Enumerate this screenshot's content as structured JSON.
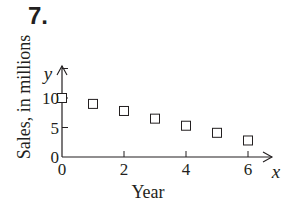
{
  "problem": {
    "number": "7."
  },
  "chart_data": {
    "type": "scatter",
    "title": "",
    "xlabel": "Year",
    "ylabel": "Sales, in millions",
    "x_axis_var": "x",
    "y_axis_var": "y",
    "x": [
      0,
      1,
      2,
      3,
      4,
      5,
      6
    ],
    "series": [
      {
        "name": "Sales",
        "marker": "open-square",
        "values": [
          10,
          9,
          7.8,
          6.5,
          5.3,
          4.1,
          2.8
        ]
      }
    ],
    "xticks": [
      0,
      2,
      4,
      6
    ],
    "yticks": [
      0,
      5,
      10
    ],
    "xtick_labels": [
      "0",
      "2",
      "4",
      "6"
    ],
    "ytick_labels": [
      "0",
      "5",
      "10"
    ],
    "xlim": [
      0,
      6.8
    ],
    "ylim": [
      0,
      14
    ],
    "grid": false,
    "legend": null
  }
}
